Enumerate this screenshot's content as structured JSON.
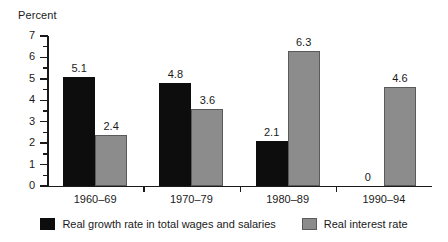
{
  "chart_data": {
    "type": "bar",
    "title": "",
    "ylabel": "Percent",
    "xlabel": "",
    "ylim": [
      0,
      7
    ],
    "ytick_labels": [
      "0",
      "1",
      "2",
      "3",
      "4",
      "5",
      "6",
      "7"
    ],
    "grid": false,
    "legend_position": "bottom-center",
    "categories": [
      "1960–69",
      "1970–79",
      "1980–89",
      "1990–94"
    ],
    "series": [
      {
        "name": "Real growth rate in total wages and salaries",
        "color": "#0d0d0d",
        "values": [
          5.1,
          4.8,
          2.1,
          0
        ],
        "labels": [
          "5.1",
          "4.8",
          "2.1",
          "0"
        ]
      },
      {
        "name": "Real interest rate",
        "color": "#8c8c8c",
        "values": [
          2.4,
          3.6,
          6.3,
          4.6
        ],
        "labels": [
          "2.4",
          "3.6",
          "6.3",
          "4.6"
        ]
      }
    ]
  },
  "legend": {
    "items": [
      {
        "label": "Real growth rate in total wages and salaries",
        "swatch": "black-swatch-icon"
      },
      {
        "label": "Real interest rate",
        "swatch": "gray-swatch-icon"
      }
    ]
  }
}
